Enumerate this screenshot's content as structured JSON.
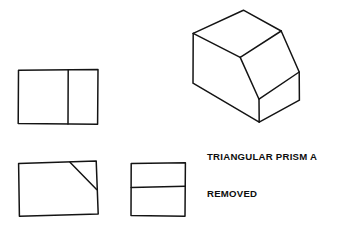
{
  "sheet": {
    "title": "Orthographic Views and Isometric Pictorial",
    "background_color": "#ffffff",
    "ink_color": "#141414",
    "width": 359,
    "height": 235
  },
  "note": {
    "line1": "TRIANGULAR PRISM A",
    "line2": "REMOVED",
    "full_text": "TRIANGULAR PRISM A REMOVED",
    "color": "#0d0d0d"
  },
  "views": {
    "top_view": {
      "name": "top-view",
      "label": "",
      "outline": "18,70 98,70 98,124 18,124",
      "divider": "68,70 68,124"
    },
    "front_view": {
      "name": "front-view",
      "label": "",
      "outline": "18,163 96,161 98,214 19,216",
      "diagonal": "70,162 96,189"
    },
    "side_view": {
      "name": "side-view",
      "label": "",
      "outline": "131,163 185,163 185,216 131,216",
      "divider": "131,187 185,186"
    },
    "pictorial": {
      "name": "isometric-pictorial",
      "top_face": "193,33 243,10 281,31 240,57",
      "slant_face": "240,57 281,31 299,72 259,99",
      "left_face": "193,33 240,57 259,99 259,122 193,83",
      "right_face": "259,99 299,72 299,100 259,122",
      "vertices": {
        "top_back_left": "193,33",
        "top_apex": "243,10",
        "top_right": "281,31",
        "top_front": "240,57",
        "slant_front": "259,99",
        "slant_right": "299,72",
        "bottom_left": "193,83",
        "bottom_front": "259,122",
        "bottom_right": "299,100"
      }
    }
  }
}
